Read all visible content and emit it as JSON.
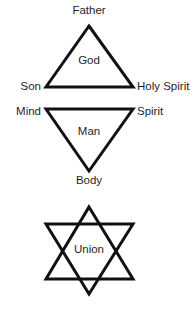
{
  "figure": {
    "background_color": "#ffffff",
    "stroke_color": "#111111",
    "text_color": "#1f1f1f",
    "stroke_width": 3
  },
  "upper_triangle": {
    "name": "God Trinity Triangle",
    "orientation": "point-up",
    "center_label": "God",
    "apex_label": "Father",
    "left_label": "Son",
    "right_label": "Holy Spirit",
    "geometry": {
      "apex_x": 89,
      "apex_y": 26,
      "left_x": 46,
      "left_y": 87,
      "right_x": 133,
      "right_y": 87
    }
  },
  "lower_triangle": {
    "name": "Man Triangle",
    "orientation": "point-down",
    "center_label": "Man",
    "apex_label": "Body",
    "left_label": "Mind",
    "right_label": "Spirit",
    "geometry": {
      "apex_x": 89,
      "apex_y": 171,
      "left_x": 46,
      "left_y": 109,
      "right_x": 133,
      "right_y": 109
    }
  },
  "hexagram": {
    "name": "Union Hexagram",
    "center_label": "Union",
    "geometry": {
      "up_apex_x": 89,
      "up_apex_y": 207,
      "up_left_x": 46,
      "up_left_y": 279,
      "up_right_x": 133,
      "up_right_y": 279,
      "down_apex_x": 89,
      "down_apex_y": 294,
      "down_left_x": 46,
      "down_left_y": 224,
      "down_right_x": 133,
      "down_right_y": 224
    }
  }
}
